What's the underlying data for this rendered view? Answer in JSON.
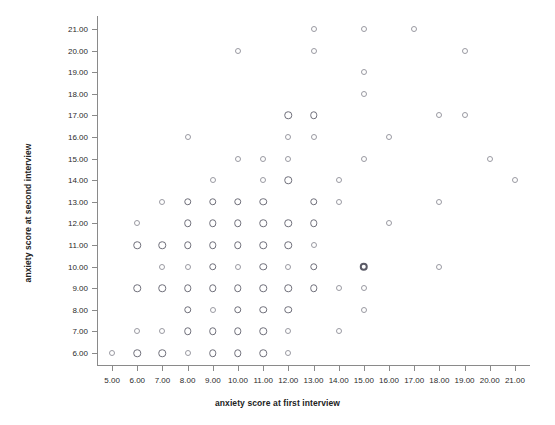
{
  "chart_data": {
    "type": "scatter",
    "title": "",
    "xlabel": "anxiety score at first interview",
    "ylabel": "anxiety score at second interview",
    "xlim": [
      4.4,
      21.6
    ],
    "ylim": [
      5.4,
      21.6
    ],
    "xticks": [
      "5.00",
      "6.00",
      "7.00",
      "8.00",
      "9.00",
      "10.00",
      "11.00",
      "12.00",
      "13.00",
      "14.00",
      "15.00",
      "16.00",
      "17.00",
      "18.00",
      "19.00",
      "20.00",
      "21.00"
    ],
    "xtick_values": [
      5,
      6,
      7,
      8,
      9,
      10,
      11,
      12,
      13,
      14,
      15,
      16,
      17,
      18,
      19,
      20,
      21
    ],
    "yticks": [
      "6.00",
      "7.00",
      "8.00",
      "9.00",
      "10.00",
      "11.00",
      "12.00",
      "13.00",
      "14.00",
      "15.00",
      "16.00",
      "17.00",
      "18.00",
      "19.00",
      "20.00",
      "21.00"
    ],
    "ytick_values": [
      6,
      7,
      8,
      9,
      10,
      11,
      12,
      13,
      14,
      15,
      16,
      17,
      18,
      19,
      20,
      21
    ],
    "grid": false,
    "legend": null,
    "marker": "open-circle",
    "marker_color": "#7a7a85",
    "points": [
      {
        "x": 13,
        "y": 21,
        "w": 1
      },
      {
        "x": 15,
        "y": 21,
        "w": 1
      },
      {
        "x": 17,
        "y": 21,
        "w": 1
      },
      {
        "x": 10,
        "y": 20,
        "w": 1
      },
      {
        "x": 13,
        "y": 20,
        "w": 1
      },
      {
        "x": 19,
        "y": 20,
        "w": 1
      },
      {
        "x": 15,
        "y": 19,
        "w": 1
      },
      {
        "x": 15,
        "y": 18,
        "w": 1
      },
      {
        "x": 12,
        "y": 17,
        "w": 2
      },
      {
        "x": 13,
        "y": 17,
        "w": 2
      },
      {
        "x": 18,
        "y": 17,
        "w": 1
      },
      {
        "x": 19,
        "y": 17,
        "w": 1
      },
      {
        "x": 8,
        "y": 16,
        "w": 1
      },
      {
        "x": 12,
        "y": 16,
        "w": 1
      },
      {
        "x": 13,
        "y": 16,
        "w": 1
      },
      {
        "x": 16,
        "y": 16,
        "w": 1
      },
      {
        "x": 10,
        "y": 15,
        "w": 1
      },
      {
        "x": 11,
        "y": 15,
        "w": 1
      },
      {
        "x": 12,
        "y": 15,
        "w": 1
      },
      {
        "x": 15,
        "y": 15,
        "w": 1
      },
      {
        "x": 20,
        "y": 15,
        "w": 1
      },
      {
        "x": 9,
        "y": 14,
        "w": 1
      },
      {
        "x": 11,
        "y": 14,
        "w": 1
      },
      {
        "x": 12,
        "y": 14,
        "w": 2
      },
      {
        "x": 14,
        "y": 14,
        "w": 1
      },
      {
        "x": 21,
        "y": 14,
        "w": 1
      },
      {
        "x": 7,
        "y": 13,
        "w": 1
      },
      {
        "x": 8,
        "y": 13,
        "w": 2
      },
      {
        "x": 9,
        "y": 13,
        "w": 2
      },
      {
        "x": 10,
        "y": 13,
        "w": 2
      },
      {
        "x": 11,
        "y": 13,
        "w": 2
      },
      {
        "x": 13,
        "y": 13,
        "w": 2
      },
      {
        "x": 14,
        "y": 13,
        "w": 1
      },
      {
        "x": 18,
        "y": 13,
        "w": 1
      },
      {
        "x": 6,
        "y": 12,
        "w": 1
      },
      {
        "x": 8,
        "y": 12,
        "w": 2
      },
      {
        "x": 9,
        "y": 12,
        "w": 2
      },
      {
        "x": 10,
        "y": 12,
        "w": 2
      },
      {
        "x": 11,
        "y": 12,
        "w": 2
      },
      {
        "x": 12,
        "y": 12,
        "w": 2
      },
      {
        "x": 13,
        "y": 12,
        "w": 2
      },
      {
        "x": 16,
        "y": 12,
        "w": 1
      },
      {
        "x": 6,
        "y": 11,
        "w": 2
      },
      {
        "x": 7,
        "y": 11,
        "w": 2
      },
      {
        "x": 8,
        "y": 11,
        "w": 2
      },
      {
        "x": 9,
        "y": 11,
        "w": 2
      },
      {
        "x": 10,
        "y": 11,
        "w": 2
      },
      {
        "x": 11,
        "y": 11,
        "w": 2
      },
      {
        "x": 12,
        "y": 11,
        "w": 2
      },
      {
        "x": 13,
        "y": 11,
        "w": 1
      },
      {
        "x": 7,
        "y": 10,
        "w": 1
      },
      {
        "x": 8,
        "y": 10,
        "w": 1
      },
      {
        "x": 9,
        "y": 10,
        "w": 2
      },
      {
        "x": 10,
        "y": 10,
        "w": 1
      },
      {
        "x": 11,
        "y": 10,
        "w": 2
      },
      {
        "x": 12,
        "y": 10,
        "w": 1
      },
      {
        "x": 13,
        "y": 10,
        "w": 2
      },
      {
        "x": 15,
        "y": 10,
        "w": 3
      },
      {
        "x": 18,
        "y": 10,
        "w": 1
      },
      {
        "x": 6,
        "y": 9,
        "w": 2
      },
      {
        "x": 7,
        "y": 9,
        "w": 2
      },
      {
        "x": 8,
        "y": 9,
        "w": 2
      },
      {
        "x": 9,
        "y": 9,
        "w": 2
      },
      {
        "x": 10,
        "y": 9,
        "w": 2
      },
      {
        "x": 11,
        "y": 9,
        "w": 2
      },
      {
        "x": 12,
        "y": 9,
        "w": 2
      },
      {
        "x": 13,
        "y": 9,
        "w": 2
      },
      {
        "x": 14,
        "y": 9,
        "w": 1
      },
      {
        "x": 15,
        "y": 9,
        "w": 1
      },
      {
        "x": 8,
        "y": 8,
        "w": 2
      },
      {
        "x": 9,
        "y": 8,
        "w": 1
      },
      {
        "x": 10,
        "y": 8,
        "w": 2
      },
      {
        "x": 11,
        "y": 8,
        "w": 2
      },
      {
        "x": 12,
        "y": 8,
        "w": 2
      },
      {
        "x": 15,
        "y": 8,
        "w": 1
      },
      {
        "x": 6,
        "y": 7,
        "w": 1
      },
      {
        "x": 7,
        "y": 7,
        "w": 1
      },
      {
        "x": 8,
        "y": 7,
        "w": 2
      },
      {
        "x": 9,
        "y": 7,
        "w": 2
      },
      {
        "x": 10,
        "y": 7,
        "w": 2
      },
      {
        "x": 11,
        "y": 7,
        "w": 2
      },
      {
        "x": 12,
        "y": 7,
        "w": 1
      },
      {
        "x": 14,
        "y": 7,
        "w": 1
      },
      {
        "x": 5,
        "y": 6,
        "w": 1
      },
      {
        "x": 6,
        "y": 6,
        "w": 2
      },
      {
        "x": 7,
        "y": 6,
        "w": 2
      },
      {
        "x": 8,
        "y": 6,
        "w": 1
      },
      {
        "x": 9,
        "y": 6,
        "w": 2
      },
      {
        "x": 10,
        "y": 6,
        "w": 2
      },
      {
        "x": 11,
        "y": 6,
        "w": 2
      },
      {
        "x": 12,
        "y": 6,
        "w": 1
      }
    ]
  }
}
